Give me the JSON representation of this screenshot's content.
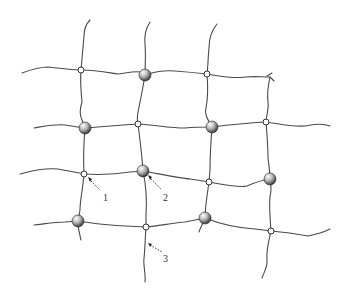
{
  "diagram": {
    "type": "network-schematic",
    "labels": [
      {
        "id": "1",
        "text": "1"
      },
      {
        "id": "2",
        "text": "2"
      },
      {
        "id": "3",
        "text": "3"
      }
    ],
    "colors": {
      "line": "#4a4a4a",
      "node_fill": "#ffffff",
      "particle_dark": "#3a3a3a",
      "particle_light": "#f2f2f2"
    }
  }
}
